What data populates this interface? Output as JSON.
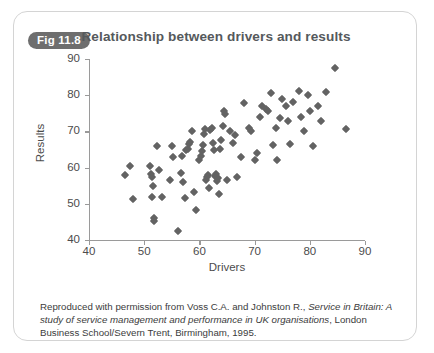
{
  "figure": {
    "badge": "Fig 11.8",
    "title": "Relationship between drivers and results",
    "caption_part1": "Reproduced with permission from Voss C.A. and Johnston R., ",
    "caption_italic1": "Service in Britain: A study of service management and performance in UK organisations",
    "caption_part2": ", London Business School/Severn Trent, Birmingham, 1995.",
    "badge_color": "#6e6e6e",
    "marker_color": "#636363",
    "axis_color": "#9a9a9a",
    "border_color": "#d4d4d4"
  },
  "chart_data": {
    "type": "scatter",
    "title": "Relationship between drivers and results",
    "xlabel": "Drivers",
    "ylabel": "Results",
    "xlim": [
      40,
      90
    ],
    "ylim": [
      40,
      90
    ],
    "xticks": [
      40,
      50,
      60,
      70,
      80,
      90
    ],
    "yticks": [
      40,
      50,
      60,
      70,
      80,
      90
    ],
    "grid": false,
    "legend": null,
    "marker": "diamond",
    "series": [
      {
        "name": "Organisations",
        "points": [
          [
            46.6,
            57.9
          ],
          [
            47.4,
            60.4
          ],
          [
            48.0,
            51.3
          ],
          [
            51.0,
            60.4
          ],
          [
            51.2,
            58.2
          ],
          [
            51.4,
            57.4
          ],
          [
            51.6,
            55.0
          ],
          [
            51.5,
            51.8
          ],
          [
            51.8,
            46.2
          ],
          [
            51.8,
            45.3
          ],
          [
            52.7,
            59.3
          ],
          [
            52.4,
            66.0
          ],
          [
            53.2,
            51.8
          ],
          [
            54.6,
            56.6
          ],
          [
            55.2,
            63.0
          ],
          [
            55.0,
            66.1
          ],
          [
            56.2,
            42.6
          ],
          [
            56.6,
            58.5
          ],
          [
            56.8,
            63.2
          ],
          [
            57.0,
            55.9
          ],
          [
            57.4,
            51.6
          ],
          [
            57.6,
            64.8
          ],
          [
            58.0,
            65.2
          ],
          [
            58.2,
            66.5
          ],
          [
            58.3,
            67.0
          ],
          [
            58.6,
            70.0
          ],
          [
            59.0,
            53.3
          ],
          [
            59.4,
            48.2
          ],
          [
            60.0,
            62.0
          ],
          [
            60.2,
            63.3
          ],
          [
            60.4,
            64.5
          ],
          [
            60.6,
            66.2
          ],
          [
            60.8,
            69.2
          ],
          [
            61.0,
            70.6
          ],
          [
            61.2,
            56.5
          ],
          [
            61.4,
            57.3
          ],
          [
            61.6,
            58.0
          ],
          [
            61.8,
            54.3
          ],
          [
            62.0,
            70.4
          ],
          [
            62.2,
            71.0
          ],
          [
            62.4,
            66.8
          ],
          [
            62.6,
            64.9
          ],
          [
            62.8,
            57.6
          ],
          [
            63.0,
            58.2
          ],
          [
            63.2,
            56.3
          ],
          [
            63.4,
            57.0
          ],
          [
            63.6,
            52.8
          ],
          [
            63.8,
            65.2
          ],
          [
            64.0,
            67.5
          ],
          [
            64.2,
            71.6
          ],
          [
            64.4,
            75.6
          ],
          [
            64.6,
            74.9
          ],
          [
            65.0,
            56.7
          ],
          [
            65.6,
            70.2
          ],
          [
            66.0,
            66.8
          ],
          [
            66.4,
            69.0
          ],
          [
            66.8,
            57.5
          ],
          [
            67.6,
            62.8
          ],
          [
            68.0,
            77.8
          ],
          [
            69.0,
            71.0
          ],
          [
            69.4,
            70.0
          ],
          [
            70.0,
            62.0
          ],
          [
            70.4,
            64.0
          ],
          [
            71.0,
            74.0
          ],
          [
            71.4,
            77.0
          ],
          [
            72.0,
            76.3
          ],
          [
            72.4,
            75.6
          ],
          [
            73.0,
            80.7
          ],
          [
            73.4,
            66.3
          ],
          [
            73.8,
            70.9
          ],
          [
            74.0,
            62.0
          ],
          [
            74.6,
            73.8
          ],
          [
            75.0,
            79.0
          ],
          [
            75.6,
            77.0
          ],
          [
            76.0,
            73.0
          ],
          [
            76.4,
            66.5
          ],
          [
            77.0,
            78.2
          ],
          [
            78.0,
            81.2
          ],
          [
            78.4,
            74.1
          ],
          [
            79.0,
            70.2
          ],
          [
            79.6,
            80.1
          ],
          [
            80.0,
            75.5
          ],
          [
            80.6,
            66.0
          ],
          [
            81.4,
            77.0
          ],
          [
            82.0,
            72.8
          ],
          [
            83.0,
            81.0
          ],
          [
            84.6,
            87.5
          ],
          [
            86.6,
            70.8
          ]
        ]
      }
    ]
  }
}
